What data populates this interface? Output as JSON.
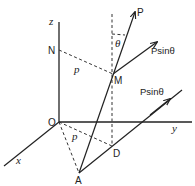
{
  "diagram": {
    "type": "3d-force-vector-diagram",
    "axes": {
      "x_label": "x",
      "y_label": "y",
      "z_label": "z"
    },
    "points": {
      "origin": "O",
      "n": "N",
      "m": "M",
      "d": "D",
      "a": "A",
      "p_tip": "P"
    },
    "distance_labels": {
      "nm": "p",
      "od": "p"
    },
    "angle_label": "θ",
    "force_components": {
      "upper": "Psinθ",
      "lower": "Psinθ"
    },
    "colors": {
      "line": "#222222",
      "background": "#ffffff"
    }
  }
}
